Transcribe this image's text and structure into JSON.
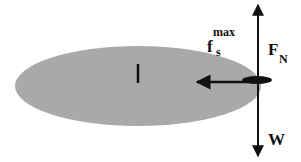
{
  "diagram": {
    "title": "",
    "colors": {
      "disk_fill": "#a9a9a9",
      "ink": "#111111",
      "background": "#ffffff"
    },
    "disk": {
      "cx": 138,
      "cy": 86,
      "rx": 123,
      "ry": 40
    },
    "center_mark": {
      "x": 138,
      "y1": 64,
      "y2": 83
    },
    "contact_blob": {
      "cx": 258,
      "cy": 80,
      "rx": 15,
      "ry": 4
    },
    "forces": [
      {
        "name": "normal-force",
        "label_main": "F",
        "label_sub": "N",
        "direction": "up"
      },
      {
        "name": "static-friction-max",
        "label_main": "f",
        "label_sub": "s",
        "label_sup": "max",
        "direction": "left"
      },
      {
        "name": "weight",
        "label_main": "W",
        "direction": "down"
      }
    ]
  }
}
